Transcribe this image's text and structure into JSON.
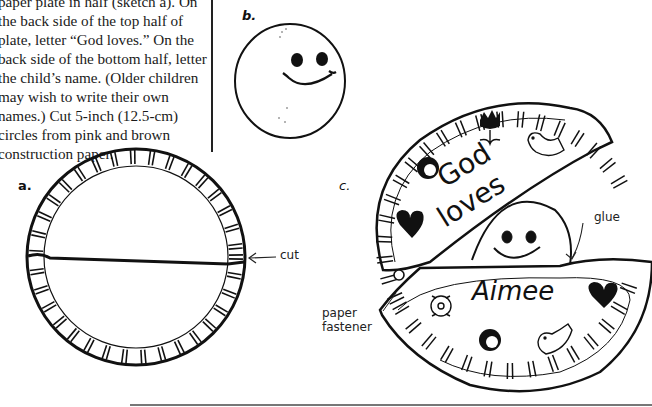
{
  "instructions": {
    "text": "paper plate in half (sketch a). On the back side of the top half of plate, letter “God loves.” On the back side of the bottom half, letter the child’s name. (Older children may wish to write their own names.) Cut 5-inch (12.5-cm) circles from pink and brown construction paper."
  },
  "sketch_a": {
    "label": "a.",
    "annotation_cut": "cut"
  },
  "sketch_b": {
    "label": "b."
  },
  "sketch_c": {
    "label": "c.",
    "top_text_line1": "God",
    "top_text_line2": "loves",
    "bottom_text": "Aimee",
    "annotation_glue": "glue",
    "annotation_fastener_line1": "paper",
    "annotation_fastener_line2": "fastener"
  },
  "icons": [
    "smiley-face",
    "tulip",
    "bird",
    "jesus-face",
    "heart",
    "flower",
    "heart",
    "jesus-face",
    "bird",
    "paper-fastener"
  ]
}
